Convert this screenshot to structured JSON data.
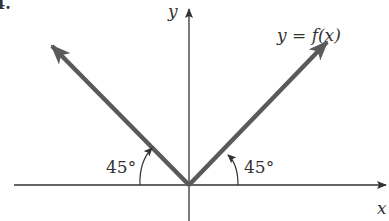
{
  "figure": {
    "number_label": "4.",
    "function_label": "y = f(x)",
    "x_axis_label": "x",
    "y_axis_label": "y",
    "left_angle_label": "45°",
    "right_angle_label": "45°"
  },
  "colors": {
    "axis": "#333333",
    "graph": "#5a5a5a",
    "text": "#333333",
    "background": "#ffffff"
  }
}
